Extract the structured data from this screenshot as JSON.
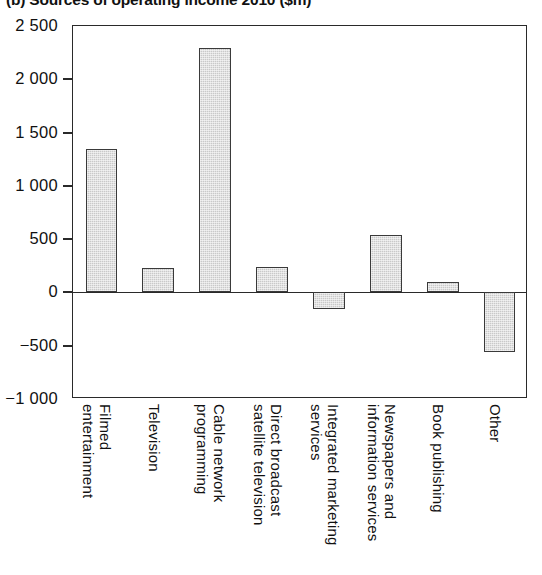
{
  "chart_data": {
    "type": "bar",
    "title": "(b) Sources of operating income 2010 ($m)",
    "xlabel": "",
    "ylabel": "",
    "ylim": [
      -1000,
      2500
    ],
    "ytick_labels": [
      "2 500",
      "2 000",
      "1 500",
      "1 000",
      "500",
      "0",
      "−500",
      "−1 000"
    ],
    "ytick_values": [
      2500,
      2000,
      1500,
      1000,
      500,
      0,
      -500,
      -1000
    ],
    "grid": false,
    "legend": "none",
    "units": "$m",
    "categories": [
      "Filmed\nentertainment",
      "Television",
      "Cable network\nprogramming",
      "Direct broadcast\nsatellite television",
      "Integrated marketing\nservices",
      "Newspapers and\ninformation services",
      "Book publishing",
      "Other"
    ],
    "values": [
      1348,
      225,
      2294,
      240,
      -160,
      535,
      100,
      -562
    ],
    "series": [
      {
        "name": "Operating income",
        "values": [
          1348,
          225,
          2294,
          240,
          -160,
          535,
          100,
          -562
        ]
      }
    ],
    "bar_fill_color": "#c9c9c9",
    "bar_edge_color": "#3a3a3a",
    "axis_color": "#2a2a2a",
    "background_color": "#ffffff"
  }
}
